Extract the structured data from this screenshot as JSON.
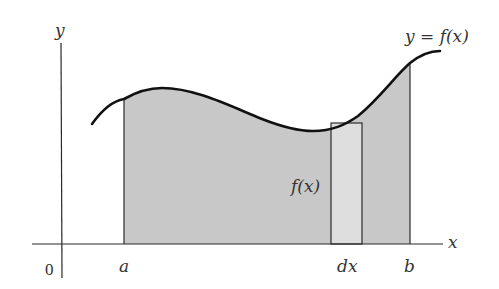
{
  "figure": {
    "type": "definite-integral-area-diagram",
    "colors": {
      "background": "#ffffff",
      "axis": "#2a2a2a",
      "curve": "#111111",
      "area_fill": "#c8c8c8",
      "strip_fill": "#dedede",
      "text": "#333333"
    },
    "labels": {
      "y_axis": "y",
      "x_axis": "x",
      "origin": "0",
      "lower_bound": "a",
      "upper_bound": "b",
      "strip_width": "dx",
      "strip_height": "f(x)",
      "curve_equation": "y = f(x)"
    }
  }
}
